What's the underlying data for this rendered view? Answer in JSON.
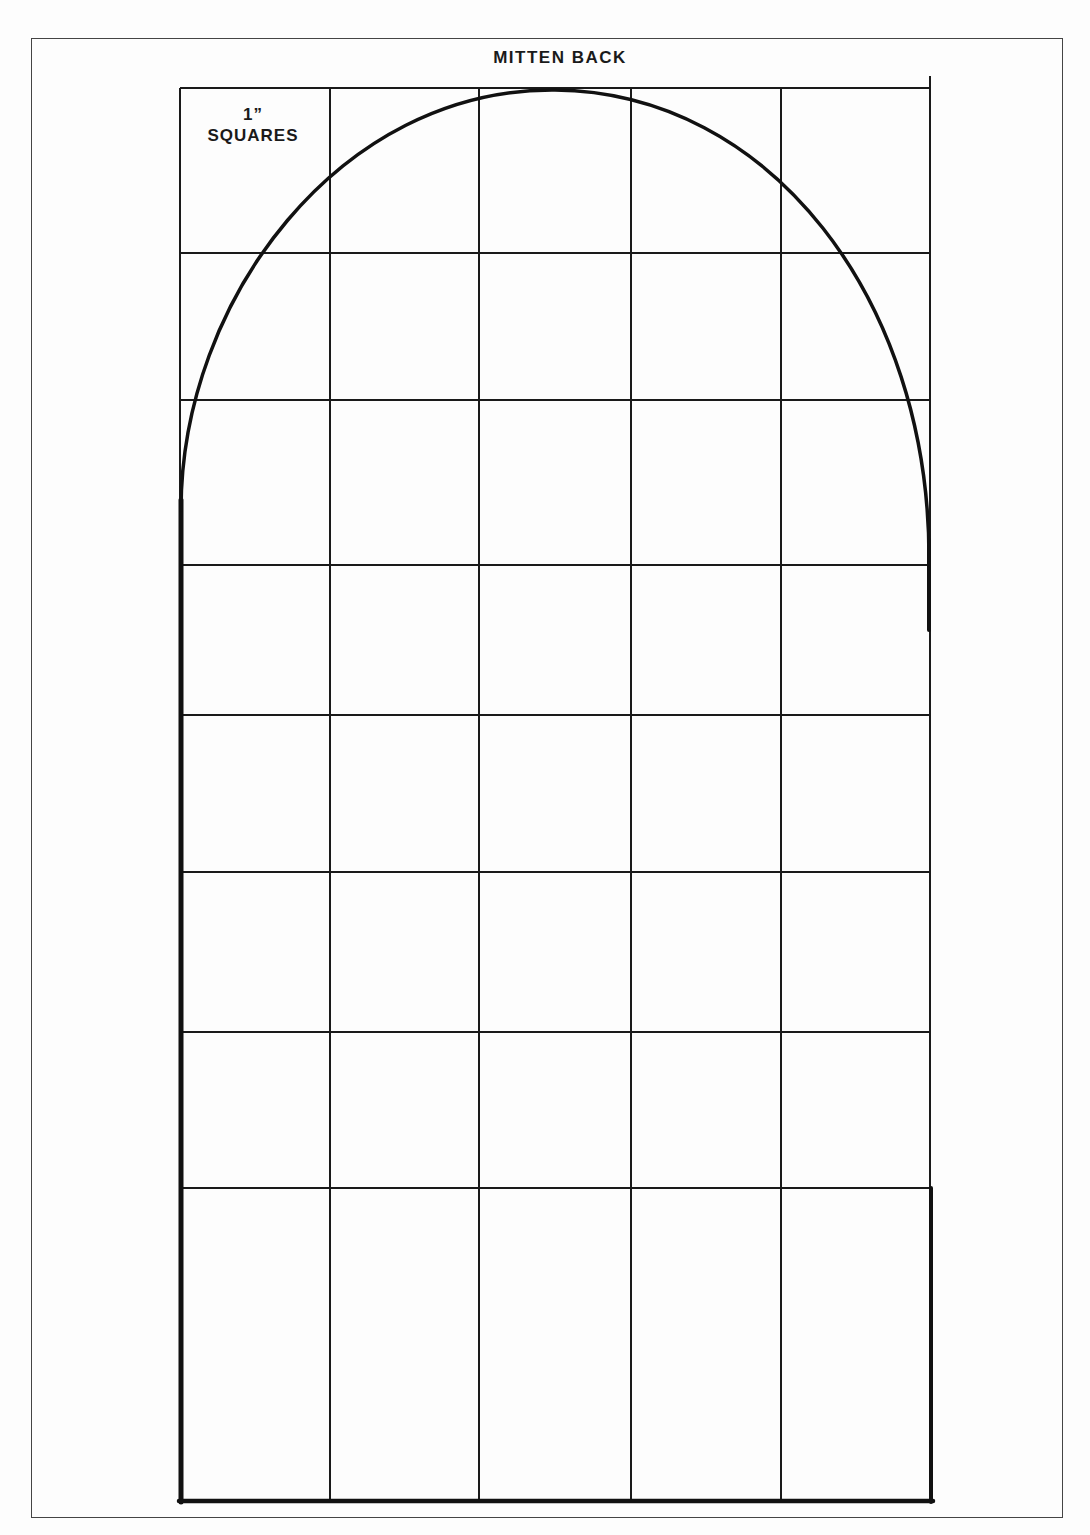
{
  "pattern": {
    "title": "MITTEN BACK",
    "scale_label_line1": "1”",
    "scale_label_line2": "SQUARES",
    "grid": {
      "columns": 5,
      "rows": 9,
      "square_size": "1 inch",
      "x_lines": [
        180,
        330,
        479,
        631,
        781,
        930
      ],
      "y_lines": [
        88,
        253,
        400,
        565,
        715,
        872,
        1032,
        1188,
        1500
      ]
    },
    "outline_color": "#111111",
    "grid_color": "#1a1a1a"
  }
}
